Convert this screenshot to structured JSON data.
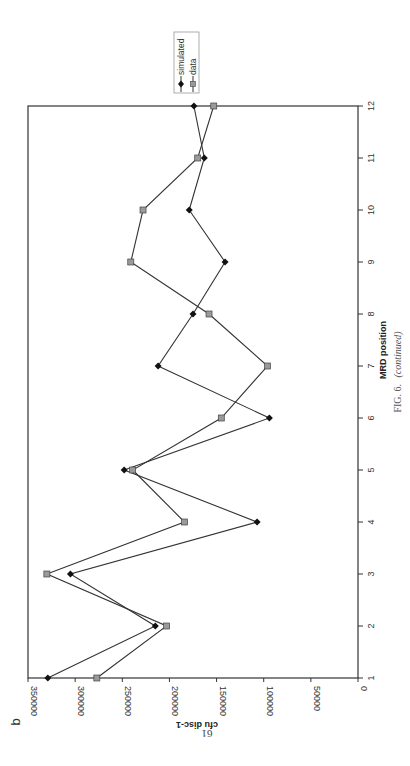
{
  "panel_label": "b",
  "caption": {
    "prefix": "FIG. 6.",
    "suffix": "(continued)"
  },
  "page_number": "61",
  "orientation": "rotated-90-ccw",
  "colors": {
    "simulated": "#111111",
    "data_fill": "#9a9a9a",
    "data_stroke": "#444444",
    "axis": "#333333",
    "line": "#333333"
  },
  "chart_data": {
    "type": "line",
    "title": "",
    "xlabel": "MRD position",
    "ylabel": "cfu disc-1",
    "x": [
      1,
      2,
      3,
      4,
      5,
      6,
      7,
      8,
      9,
      10,
      11,
      12
    ],
    "x_tick_labels": [
      "1",
      "2",
      "3",
      "4",
      "5",
      "6",
      "7",
      "8",
      "9",
      "10",
      "11",
      "12"
    ],
    "ylim": [
      0,
      350000
    ],
    "y_ticks": [
      0,
      50000,
      100000,
      150000,
      200000,
      250000,
      300000,
      350000
    ],
    "y_tick_labels": [
      "0",
      "50000",
      "100000",
      "150000",
      "200000",
      "250000",
      "300000",
      "350000"
    ],
    "grid": false,
    "legend_position": "top-right",
    "series": [
      {
        "name": "simulated",
        "marker": "diamond",
        "values": [
          329000,
          215000,
          305000,
          107000,
          248000,
          94000,
          212000,
          175000,
          141000,
          179000,
          163000,
          174000
        ]
      },
      {
        "name": "data",
        "marker": "square",
        "values": [
          277000,
          203000,
          330000,
          184000,
          239000,
          145000,
          96000,
          158000,
          241000,
          228000,
          170000,
          153000
        ]
      }
    ]
  }
}
